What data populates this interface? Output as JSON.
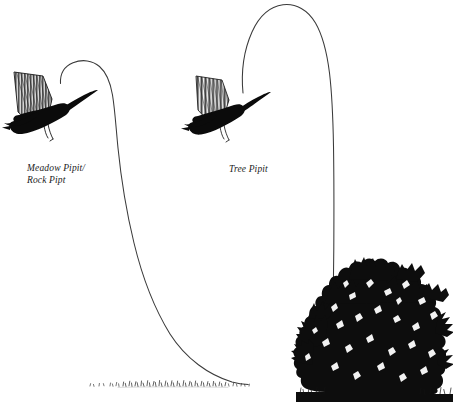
{
  "figure": {
    "background_color": "#ffffff",
    "width": 453,
    "height": 402
  },
  "labels": {
    "left": {
      "line1": "Meadow Pipit/",
      "line2": "Rock Pipt",
      "text": "Meadow Pipit/\nRock Pipt"
    },
    "right": {
      "line1": "Tree Pipit",
      "text": "Tree Pipit"
    }
  },
  "colors": {
    "ink": "#111111",
    "line": "#3a3a3a",
    "wing_hatch": "#2b2b2b",
    "wing_field": "#f2f2f2",
    "background": "#ffffff"
  },
  "birds": [
    {
      "name": "meadow-rock-pipit-bird",
      "label": "Meadow Pipit/Rock Pipt",
      "x": 48,
      "y": 105,
      "scale": 1.0,
      "facing": "left"
    },
    {
      "name": "tree-pipit-bird",
      "label": "Tree Pipit",
      "x": 226,
      "y": 108,
      "scale": 0.9,
      "facing": "left"
    }
  ],
  "flight_paths": [
    {
      "name": "meadow-rock-pipit-flight-path",
      "description": "Long shallow parachuting descent ending on open ground",
      "start": [
        60,
        82
      ],
      "peak": [
        96,
        62
      ],
      "end": [
        248,
        383
      ]
    },
    {
      "name": "tree-pipit-flight-path",
      "description": "Tall narrow arch rising high then dropping back into a bush",
      "start": [
        243,
        92
      ],
      "peak": [
        289,
        5
      ],
      "end": [
        333,
        301
      ]
    }
  ],
  "ground": {
    "name": "grass-tuft-line",
    "start_x": 88,
    "end_x": 252,
    "y": 385
  },
  "bush": {
    "name": "bush",
    "left": 298,
    "right": 453,
    "top": 261,
    "bottom": 394
  }
}
